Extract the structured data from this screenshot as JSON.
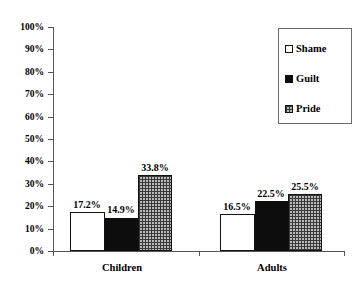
{
  "chart_data": {
    "type": "bar",
    "title": "",
    "subtitle": "",
    "xlabel": "",
    "ylabel": "",
    "categories": [
      "Children",
      "Adults"
    ],
    "series": [
      {
        "name": "Shame",
        "values": [
          17.2,
          14.9
        ],
        "swatch": "white",
        "color": "#ffffff"
      },
      {
        "name": "Guilt",
        "values": [
          14.9,
          22.5
        ],
        "swatch": "black",
        "color": "#0d0d0d"
      },
      {
        "name": "Pride",
        "values": [
          33.8,
          25.5
        ],
        "swatch": "crosshatch",
        "color": "#b9b9b9"
      }
    ],
    "bars": [
      {
        "group": "Children",
        "series": "Shame",
        "value": 17.2,
        "label": "17.2%"
      },
      {
        "group": "Children",
        "series": "Guilt",
        "value": 14.9,
        "label": "14.9%"
      },
      {
        "group": "Children",
        "series": "Pride",
        "value": 33.8,
        "label": "33.8%"
      },
      {
        "group": "Adults",
        "series": "Shame",
        "value": 16.5,
        "label": "16.5%"
      },
      {
        "group": "Adults",
        "series": "Guilt",
        "value": 22.5,
        "label": "22.5%"
      },
      {
        "group": "Adults",
        "series": "Pride",
        "value": 25.5,
        "label": "25.5%"
      }
    ],
    "ylim": [
      0,
      100
    ],
    "ytick_step": 10,
    "ytick_labels": [
      "100%",
      "90%",
      "80%",
      "70%",
      "60%",
      "50%",
      "40%",
      "30%",
      "20%",
      "10%",
      "0%"
    ],
    "grid": false,
    "legend_position": "top-right",
    "legend_entries": [
      "Shame",
      "Guilt",
      "Pride"
    ]
  },
  "axis": {
    "y": {
      "t100": "100%",
      "t90": "90%",
      "t80": "80%",
      "t70": "70%",
      "t60": "60%",
      "t50": "50%",
      "t40": "40%",
      "t30": "30%",
      "t20": "20%",
      "t10": "10%",
      "t0": "0%"
    },
    "x": {
      "cat0": "Children",
      "cat1": "Adults"
    }
  },
  "labels": {
    "children_shame": "17.2%",
    "children_guilt": "14.9%",
    "children_pride": "33.8%",
    "adults_shame": "16.5%",
    "adults_guilt": "22.5%",
    "adults_pride": "25.5%"
  },
  "legend": {
    "shame": "Shame",
    "guilt": "Guilt",
    "pride": "Pride"
  },
  "colors": {
    "shame": "#ffffff",
    "guilt": "#0d0d0d",
    "pride": "#b9b9b9",
    "axis": "#555555",
    "outline": "#111111",
    "background": "#ffffff"
  }
}
